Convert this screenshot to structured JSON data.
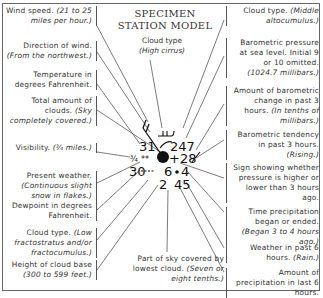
{
  "title": [
    "SPECIMEN",
    "STATION MODEL"
  ],
  "top_label": {
    "text": "Cloud type",
    "detail": "(High cirrus)"
  },
  "bottom_label": {
    "text": "Part of sky covered by lowest cloud.",
    "detail": "(Seven or eight tenths.)"
  },
  "left_labels": [
    {
      "text": "Wind speed.",
      "detail": "(21 to 25 miles per hour.)"
    },
    {
      "text": "Direction of wind.",
      "detail": "(From the northwest.)"
    },
    {
      "text": "Temperature in degrees Fahrenheit.",
      "detail": ""
    },
    {
      "text": "Total amount of clouds.",
      "detail": "(Sky completely covered.)"
    },
    {
      "text": "Visibility.",
      "detail": "(¾ miles.)"
    },
    {
      "text": "Present weather.",
      "detail": "(Continuous slight snow in flakes.)"
    },
    {
      "text": "Dewpoint in degrees Fahrenheit.",
      "detail": ""
    },
    {
      "text": "Cloud type.",
      "detail": "(Low fractostratus and/or fractocumulus.)"
    },
    {
      "text": "Height of cloud base",
      "detail": "(300 to 599 feet.)"
    }
  ],
  "right_labels": [
    {
      "text": "Cloud type.",
      "detail": "(Middle altocumulus.)"
    },
    {
      "text": "Barometric pressure at sea level. Initial 9 or 10 omitted.",
      "detail": "(1024.7 millibars.)"
    },
    {
      "text": "Amount of barometric change in past 3 hours.",
      "detail": "(In tenths of millibars.)"
    },
    {
      "text": "Barometric tendency in past 3 hours.",
      "detail": "(Rising.)"
    },
    {
      "text": "Sign showing whether pressure is higher or lower than 3 hours ago.",
      "detail": ""
    },
    {
      "text": "Time precipitation began or ended.",
      "detail": "(Began 3 to 4 hours ago.)"
    },
    {
      "text": "Weather in past 6 hours.",
      "detail": "(Rain.)"
    },
    {
      "text": "Amount of precipitation in last 6 hours.",
      "detail": ""
    }
  ],
  "model": {
    "temperature": "31",
    "pressure": "247",
    "visibility": "¾",
    "present_weather": "**",
    "pressure_change": "+28",
    "dewpoint": "30",
    "cloud_height": "6",
    "time_precip": "4",
    "low_cloud_cover": "2",
    "precip_amount": "45"
  }
}
